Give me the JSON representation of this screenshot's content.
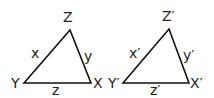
{
  "diagram": {
    "triangles": [
      {
        "name": "triangle-xyz",
        "vertices": {
          "Z": "Z",
          "Y": "Y",
          "X": "X"
        },
        "sides": {
          "x": "x",
          "y": "y",
          "z": "z"
        },
        "points": "24,83 70,30 91,83"
      },
      {
        "name": "triangle-xyz-prime",
        "vertices": {
          "Z": "Z′",
          "Y": "Y′",
          "X": "X′"
        },
        "sides": {
          "x": "x′",
          "y": "y′",
          "z": "z′"
        },
        "points": "123,83 169,29 189,83"
      }
    ],
    "stroke_color": "#111111"
  }
}
